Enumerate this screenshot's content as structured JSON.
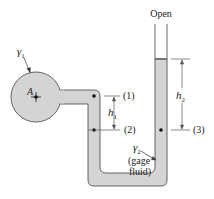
{
  "diagram": {
    "type": "manometer",
    "labels": {
      "open": "Open",
      "gamma1": "γ",
      "gamma1_sub": "1",
      "point_A": "A",
      "point1": "(1)",
      "point2": "(2)",
      "point3": "(3)",
      "h1": "h",
      "h1_sub": "1",
      "h2": "h",
      "h2_sub": "2",
      "gamma2": "γ",
      "gamma2_sub": "2",
      "gage_line1": "(gage",
      "gage_line2": "fluid)"
    },
    "colors": {
      "fluid": "#d4d4d4",
      "outline": "#555555",
      "text": "#222222"
    }
  }
}
